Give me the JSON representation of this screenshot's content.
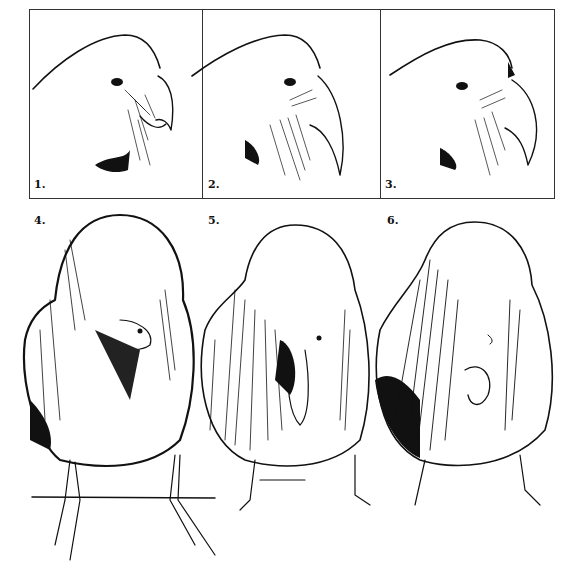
{
  "figure": {
    "panels": [
      {
        "id": 1,
        "label": "1.",
        "view": "head profile"
      },
      {
        "id": 2,
        "label": "2.",
        "view": "head profile"
      },
      {
        "id": 3,
        "label": "3.",
        "view": "head profile"
      },
      {
        "id": 4,
        "label": "4.",
        "view": "front body"
      },
      {
        "id": 5,
        "label": "5.",
        "view": "front body"
      },
      {
        "id": 6,
        "label": "6.",
        "view": "front body"
      }
    ],
    "colors": {
      "ink": "#111111",
      "paper": "#ffffff",
      "border": "#333333"
    }
  }
}
